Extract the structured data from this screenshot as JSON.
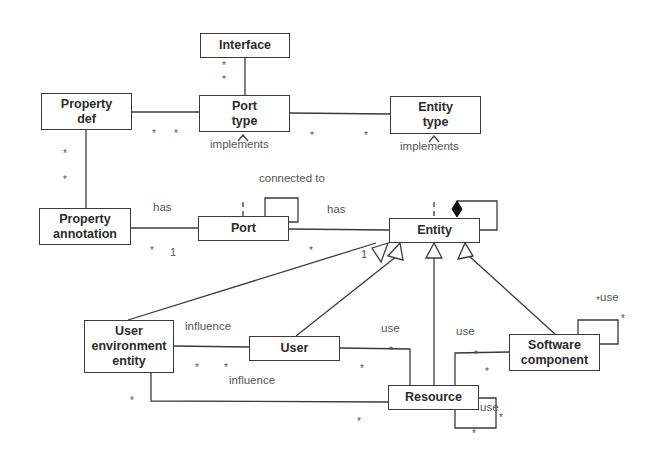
{
  "diagram": {
    "type": "UML class diagram",
    "classes": [
      {
        "id": "interface",
        "label": "Interface"
      },
      {
        "id": "property_def",
        "label": "Property\ndef"
      },
      {
        "id": "port_type",
        "label": "Port\ntype"
      },
      {
        "id": "entity_type",
        "label": "Entity\ntype"
      },
      {
        "id": "property_annotation",
        "label": "Property\nannotation"
      },
      {
        "id": "port",
        "label": "Port"
      },
      {
        "id": "entity",
        "label": "Entity"
      },
      {
        "id": "user_environment_entity",
        "label": "User\nenvironment\nentity"
      },
      {
        "id": "user",
        "label": "User"
      },
      {
        "id": "resource",
        "label": "Resource"
      },
      {
        "id": "software_component",
        "label": "Software\ncomponent"
      }
    ],
    "labels": {
      "port_type_implements": "implements",
      "entity_type_implements": "implements",
      "connected_to": "connected to",
      "annotation_has": "has",
      "port_entity_has": "has",
      "user_env_influence_user": "influence",
      "user_env_influence_resource": "influence",
      "user_use": "use",
      "software_use": "use",
      "software_self_use": "use",
      "resource_self_use": "use"
    },
    "multiplicities": {
      "interface_port_type_1": "*",
      "interface_port_type_2": "*",
      "propdef_porttype_1": "*",
      "propdef_porttype_2": "*",
      "porttype_entitytype_1": "*",
      "porttype_entitytype_2": "*",
      "propdef_annotation_1": "*",
      "propdef_annotation_2": "*",
      "annotation_port_many": "*",
      "annotation_port_one": "1",
      "port_entity_many": "*",
      "port_entity_one": "1",
      "userenv_user_1": "*",
      "userenv_user_2": "*",
      "userenv_resource_1": "*",
      "userenv_resource_2": "*",
      "user_resource_1": "*",
      "user_resource_2": "*",
      "software_resource_1": "*",
      "software_resource_2": "*",
      "software_self_1": "*",
      "software_self_2": "*",
      "resource_self_1": "*",
      "resource_self_2": "*"
    },
    "relations": [
      {
        "from": "Interface",
        "to": "Port type",
        "kind": "association"
      },
      {
        "from": "Property def",
        "to": "Port type",
        "kind": "association"
      },
      {
        "from": "Port type",
        "to": "Entity type",
        "kind": "association"
      },
      {
        "from": "Property def",
        "to": "Property annotation",
        "kind": "association"
      },
      {
        "from": "Port",
        "to": "Port type",
        "kind": "realization",
        "label": "implements"
      },
      {
        "from": "Entity",
        "to": "Entity type",
        "kind": "realization",
        "label": "implements"
      },
      {
        "from": "Port",
        "to": "Port",
        "kind": "self-association",
        "label": "connected to"
      },
      {
        "from": "Property annotation",
        "to": "Port",
        "kind": "association",
        "label": "has"
      },
      {
        "from": "Port",
        "to": "Entity",
        "kind": "association",
        "label": "has"
      },
      {
        "from": "Entity",
        "to": "Entity",
        "kind": "composition"
      },
      {
        "from": "User environment entity",
        "to": "Entity",
        "kind": "generalization"
      },
      {
        "from": "User",
        "to": "Entity",
        "kind": "generalization"
      },
      {
        "from": "Resource",
        "to": "Entity",
        "kind": "generalization"
      },
      {
        "from": "Software component",
        "to": "Entity",
        "kind": "generalization"
      },
      {
        "from": "User environment entity",
        "to": "User",
        "kind": "association",
        "label": "influence"
      },
      {
        "from": "User environment entity",
        "to": "Resource",
        "kind": "association",
        "label": "influence"
      },
      {
        "from": "User",
        "to": "Resource",
        "kind": "association",
        "label": "use"
      },
      {
        "from": "Software component",
        "to": "Resource",
        "kind": "association",
        "label": "use"
      },
      {
        "from": "Software component",
        "to": "Software component",
        "kind": "self-association",
        "label": "use"
      },
      {
        "from": "Resource",
        "to": "Resource",
        "kind": "self-association",
        "label": "use"
      }
    ]
  }
}
